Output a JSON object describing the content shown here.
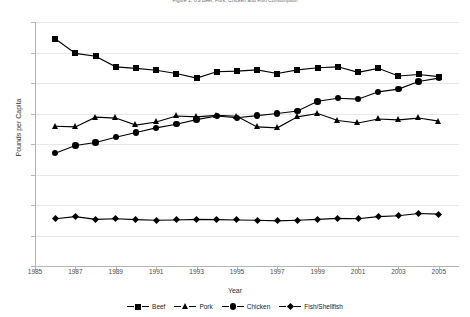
{
  "chart_data": {
    "type": "line",
    "title": "Figure 1. US Beef, Pork, Chicken and Fish Consumption",
    "xlabel": "Year",
    "ylabel": "Pounds per Capita",
    "ylim": [
      0.0,
      80.0
    ],
    "xlim": [
      1985,
      2006
    ],
    "grid": true,
    "legend_position": "bottom",
    "y_ticks": [
      "0.0",
      "10.0",
      "20.0",
      "30.0",
      "40.0",
      "50.0",
      "60.0",
      "70.0",
      "80.0"
    ],
    "y_tick_values": [
      0,
      10,
      20,
      30,
      40,
      50,
      60,
      70,
      80
    ],
    "x_ticks": [
      "1985",
      "1987",
      "1989",
      "1991",
      "1993",
      "1995",
      "1997",
      "1999",
      "2001",
      "2003",
      "2005"
    ],
    "x_tick_values": [
      1985,
      1987,
      1989,
      1991,
      1993,
      1995,
      1997,
      1999,
      2001,
      2003,
      2005
    ],
    "x": [
      1986,
      1987,
      1988,
      1989,
      1990,
      1991,
      1992,
      1993,
      1994,
      1995,
      1996,
      1997,
      1998,
      1999,
      2000,
      2001,
      2002,
      2003,
      2004,
      2005
    ],
    "series": [
      {
        "name": "Beef",
        "marker": "square",
        "color": "#000000",
        "values": [
          74.5,
          69.7,
          68.8,
          65.3,
          64.8,
          64.2,
          63.1,
          61.6,
          63.7,
          63.9,
          64.3,
          63.1,
          64.3,
          65.0,
          65.3,
          63.5,
          64.8,
          62.3,
          62.8,
          62.1
        ]
      },
      {
        "name": "Pork",
        "marker": "triangle",
        "color": "#000000",
        "values": [
          45.8,
          45.6,
          48.8,
          48.5,
          46.2,
          47.2,
          49.2,
          48.9,
          49.4,
          49.1,
          45.6,
          45.3,
          48.9,
          50.0,
          47.7,
          46.9,
          48.2,
          47.9,
          48.5,
          47.5
        ]
      },
      {
        "name": "Chicken",
        "marker": "circle",
        "color": "#000000",
        "values": [
          37.0,
          39.5,
          40.5,
          42.2,
          43.8,
          45.3,
          46.5,
          48.0,
          49.2,
          48.6,
          49.3,
          50.0,
          50.8,
          54.0,
          55.0,
          54.7,
          57.1,
          58.0,
          60.5,
          61.6
        ]
      },
      {
        "name": "Fish/Shellfish",
        "marker": "diamond",
        "color": "#000000",
        "values": [
          15.5,
          16.2,
          15.3,
          15.5,
          15.2,
          15.0,
          15.1,
          15.3,
          15.2,
          15.1,
          15.0,
          14.8,
          15.0,
          15.3,
          15.6,
          15.5,
          16.2,
          16.5,
          17.2,
          17.0
        ]
      }
    ]
  }
}
